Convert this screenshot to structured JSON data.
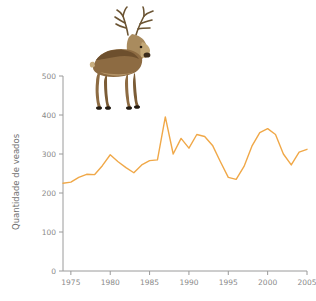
{
  "figure": {
    "background_color": "#ffffff",
    "overlay_image_name": "red-deer-stag-photo"
  },
  "axis": {
    "y_title": "Quantidade de veados",
    "y_ticks": [
      "0",
      "100",
      "200",
      "300",
      "400",
      "500"
    ],
    "x_ticks": [
      "1975",
      "1980",
      "1985",
      "1990",
      "1995",
      "2000",
      "2005"
    ],
    "axis_color": "#9a9a9a",
    "tick_label_color": "#8a8a8a",
    "title_color": "#6f6f6f"
  },
  "chart_data": {
    "type": "line",
    "title": "",
    "xlabel": "",
    "ylabel": "Quantidade de veados",
    "xlim": [
      1974,
      2005
    ],
    "ylim": [
      0,
      500
    ],
    "grid": false,
    "legend": false,
    "line_color": "#F0A848",
    "x": [
      1974,
      1975,
      1976,
      1977,
      1978,
      1979,
      1980,
      1981,
      1982,
      1983,
      1984,
      1985,
      1986,
      1987,
      1988,
      1989,
      1990,
      1991,
      1992,
      1993,
      1994,
      1995,
      1996,
      1997,
      1998,
      1999,
      2000,
      2001,
      2002,
      2003,
      2004,
      2005
    ],
    "values": [
      225,
      228,
      240,
      248,
      247,
      270,
      298,
      280,
      265,
      252,
      272,
      283,
      285,
      395,
      300,
      340,
      315,
      350,
      345,
      322,
      280,
      240,
      235,
      268,
      320,
      355,
      365,
      350,
      300,
      272,
      305,
      312
    ],
    "series": [
      {
        "name": "Quantidade de veados",
        "color": "#F0A848",
        "values": [
          225,
          228,
          240,
          248,
          247,
          270,
          298,
          280,
          265,
          252,
          272,
          283,
          285,
          395,
          300,
          340,
          315,
          350,
          345,
          322,
          280,
          240,
          235,
          268,
          320,
          355,
          365,
          350,
          300,
          272,
          305,
          312
        ]
      }
    ]
  }
}
